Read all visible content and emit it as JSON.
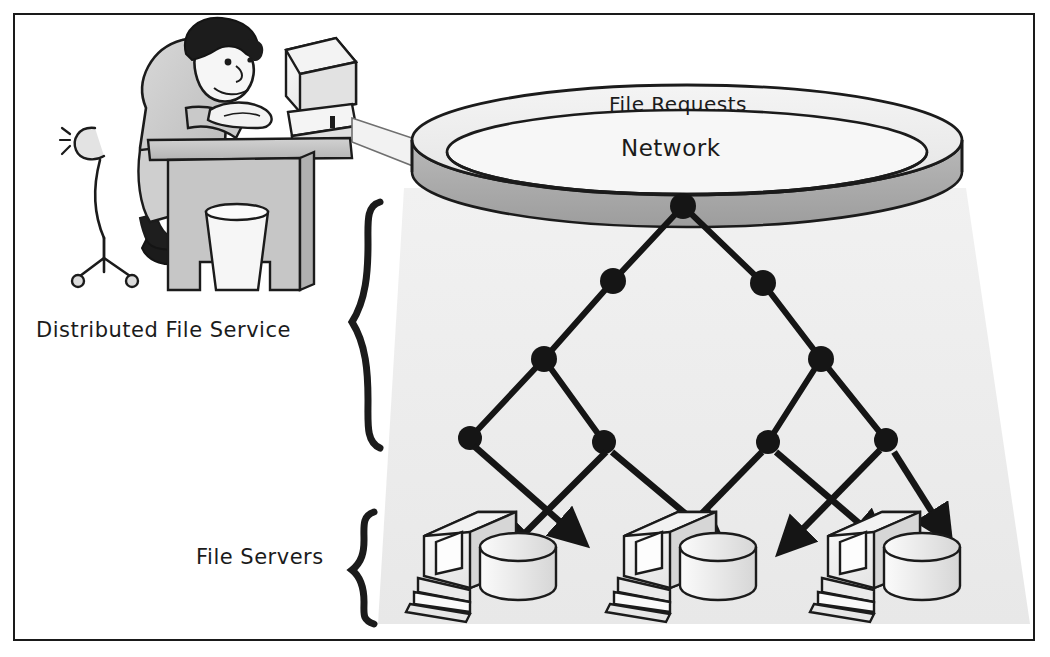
{
  "figure": {
    "border_color": "#1a1a1a",
    "background_color": "#ffffff",
    "shade_color": "#ececec",
    "ring_top_color": "#efefef",
    "ring_side_color": "#a8a8a8",
    "node_color": "#1a1a1a",
    "ink_color": "#1b1b1b"
  },
  "labels": {
    "file_requests": "File Requests",
    "network": "Network",
    "distributed_file_service": "Distributed File Service",
    "file_servers": "File Servers"
  },
  "braces": {
    "dfs_brace": "{",
    "servers_brace": "{"
  },
  "network_ring": {
    "cx": 687,
    "cy": 140,
    "rx": 275,
    "ry": 55,
    "band_height": 45
  },
  "tree": {
    "root": {
      "x": 683,
      "y": 206,
      "r": 13
    },
    "level2": [
      {
        "x": 613,
        "y": 281,
        "r": 13
      },
      {
        "x": 763,
        "y": 283,
        "r": 13
      }
    ],
    "level3": [
      {
        "x": 544,
        "y": 359,
        "r": 13
      },
      {
        "x": 821,
        "y": 359,
        "r": 13
      }
    ],
    "leaves": [
      {
        "x": 470,
        "y": 438,
        "r": 12
      },
      {
        "x": 604,
        "y": 442,
        "r": 12
      },
      {
        "x": 768,
        "y": 442,
        "r": 12
      },
      {
        "x": 886,
        "y": 440,
        "r": 12
      }
    ],
    "edges": [
      [
        683,
        206,
        613,
        281
      ],
      [
        683,
        206,
        763,
        283
      ],
      [
        613,
        281,
        544,
        359
      ],
      [
        763,
        283,
        821,
        359
      ],
      [
        544,
        359,
        470,
        438
      ],
      [
        544,
        359,
        604,
        442
      ],
      [
        821,
        359,
        768,
        442
      ],
      [
        821,
        359,
        886,
        440
      ]
    ]
  },
  "arrows": [
    {
      "from": [
        472,
        444
      ],
      "to": [
        578,
        538
      ],
      "name": "leaf1-to-server1"
    },
    {
      "from": [
        612,
        450
      ],
      "to": [
        716,
        540
      ],
      "name": "leaf2-to-server2"
    },
    {
      "from": [
        604,
        450
      ],
      "to": [
        508,
        548
      ],
      "name": "leaf2-to-server1-cross"
    },
    {
      "from": [
        762,
        450
      ],
      "to": [
        668,
        546
      ],
      "name": "leaf3-to-server2-cross"
    },
    {
      "from": [
        776,
        450
      ],
      "to": [
        880,
        540
      ],
      "name": "leaf3-to-server3"
    },
    {
      "from": [
        878,
        448
      ],
      "to": [
        784,
        545
      ],
      "name": "leaf4-to-server2"
    },
    {
      "from": [
        894,
        450
      ],
      "to": [
        948,
        530
      ],
      "name": "leaf4-to-server3"
    }
  ],
  "servers": [
    {
      "x": 410,
      "y": 505,
      "label": "file-server-1"
    },
    {
      "x": 610,
      "y": 505,
      "label": "file-server-2"
    },
    {
      "x": 815,
      "y": 505,
      "label": "file-server-3"
    }
  ],
  "workstation": {
    "name": "user-at-desk",
    "person": "seated user typing",
    "desk": true,
    "monitor": true,
    "chair": true,
    "wastebasket": true,
    "cable_to_network": true
  },
  "shaded_cone": {
    "top_left": [
      404,
      190
    ],
    "top_right": [
      966,
      190
    ],
    "bottom_left": [
      378,
      624
    ],
    "bottom_right": [
      1030,
      624
    ]
  }
}
